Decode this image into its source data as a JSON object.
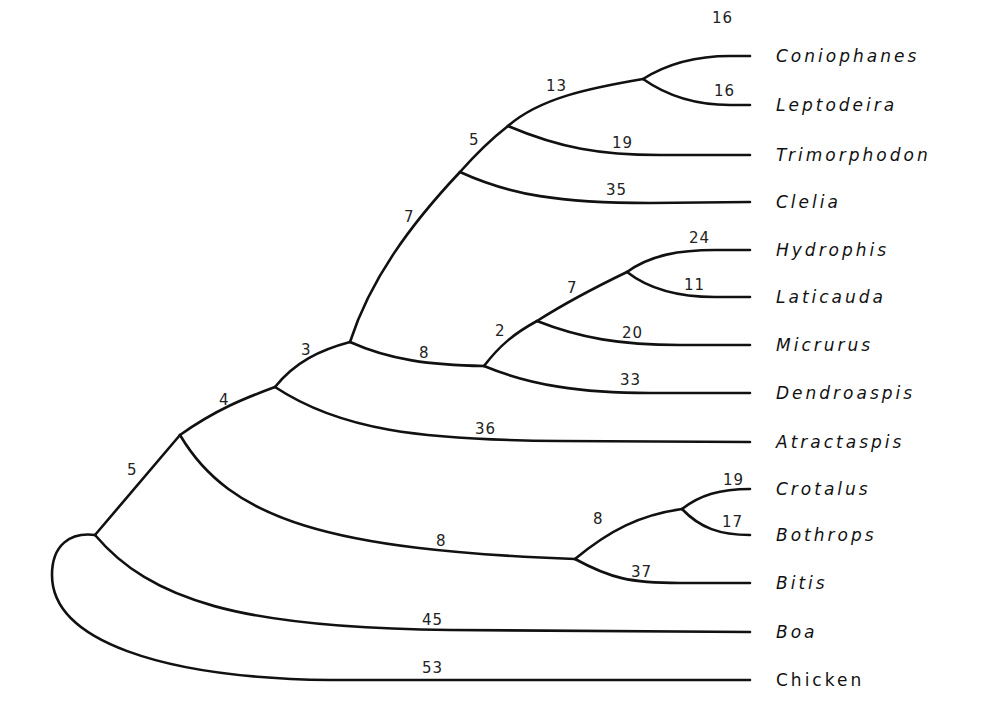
{
  "figure": {
    "type": "phylogenetic-tree",
    "taxa": [
      {
        "name": "Coniophanes",
        "italic": true
      },
      {
        "name": "Leptodeira",
        "italic": true
      },
      {
        "name": "Trimorphodon",
        "italic": true
      },
      {
        "name": "Clelia",
        "italic": true
      },
      {
        "name": "Hydrophis",
        "italic": true
      },
      {
        "name": "Laticauda",
        "italic": true
      },
      {
        "name": "Micrurus",
        "italic": true
      },
      {
        "name": "Dendroaspis",
        "italic": true
      },
      {
        "name": "Atractaspis",
        "italic": true
      },
      {
        "name": "Crotalus",
        "italic": true
      },
      {
        "name": "Bothrops",
        "italic": true
      },
      {
        "name": "Bitis",
        "italic": true
      },
      {
        "name": "Boa",
        "italic": true
      },
      {
        "name": "Chicken",
        "italic": false
      }
    ],
    "branch_lengths": {
      "coniophanes": "16",
      "leptodeira": "16",
      "coniophanes_leptodeira_stem": "13",
      "trimorphodon": "19",
      "colubrid_inner_stem": "5",
      "clelia": "35",
      "colubrid_stem": "7",
      "hydrophis": "24",
      "laticauda": "11",
      "hydrophis_laticauda_stem": "7",
      "micrurus": "20",
      "elapid_inner_stem": "2",
      "dendroaspis": "33",
      "elapid_stem": "8",
      "colubroid_stem": "3",
      "atractaspis": "36",
      "caenophidian_stem": "4",
      "crotalus": "19",
      "bothrops": "17",
      "crotalus_bothrops_stem": "8",
      "bitis": "37",
      "viperid_stem": "8",
      "advanced_snake_stem": "5",
      "boa": "45",
      "chicken": "53"
    }
  }
}
